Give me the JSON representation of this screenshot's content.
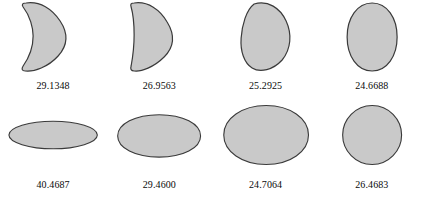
{
  "figure": {
    "background_color": "#ffffff",
    "shape_fill_color": "#c9c9c9",
    "shape_stroke_color": "#3a3a3a",
    "label_color": "#0a0a0a",
    "rows": 2,
    "columns": 4
  },
  "chart_data": {
    "type": "table",
    "title": "",
    "xlabel": "",
    "ylabel": "",
    "layout": {
      "rows": 2,
      "columns": 4,
      "grid": false,
      "legend": "none"
    },
    "categories": [
      "shape-1",
      "shape-2",
      "shape-3",
      "shape-4",
      "shape-5",
      "shape-6",
      "shape-7",
      "shape-8"
    ],
    "values": [
      29.1348,
      26.9563,
      25.2925,
      24.6688,
      40.4687,
      29.46,
      24.7064,
      26.4683
    ],
    "labels": [
      "29.1348",
      "26.9563",
      "25.2925",
      "24.6688",
      "40.4687",
      "29.4600",
      "24.7064",
      "26.4683"
    ],
    "shape_names": [
      "concave-rounded-triangle",
      "rounded-triangle",
      "asymmetric-egg",
      "vertical-ellipse",
      "flat-wide-ellipse",
      "wide-ellipse",
      "broad-ellipse",
      "circle"
    ]
  },
  "cells": [
    {
      "index": 1,
      "row": 1,
      "label": "29.1348",
      "shape_name": "concave-rounded-triangle",
      "path": "M 26 3 C 40 1 52 9 60 21 C 68 33 68 45 58 56 C 48 67 34 72 25 71 C 22 71 21 69 23 66 C 30 56 33 44 33 36 C 33 28 30 16 23 7 C 21 4 23 3 26 3 Z"
    },
    {
      "index": 2,
      "row": 1,
      "label": "26.9563",
      "shape_name": "rounded-triangle",
      "path": "M 28 3 C 42 1 54 10 61 22 C 69 35 68 47 58 57 C 48 67 35 72 28 71 C 25 71 24 69 25 66 C 27 55 28 44 28 35 C 28 25 27 14 25 7 C 24 4 25 3 28 3 Z"
    },
    {
      "index": 3,
      "row": 1,
      "label": "25.2925",
      "shape_name": "asymmetric-egg",
      "path": "M 34 4 C 48 0 60 8 66 21 C 72 34 71 49 62 60 C 53 70 40 73 32 68 C 24 63 20 51 21 38 C 22 25 26 10 34 4 Z"
    },
    {
      "index": 4,
      "row": 1,
      "label": "24.6688",
      "shape_name": "vertical-ellipse",
      "path": "M 45 3 C 60 3 70 18 70 37 C 70 56 60 71 45 71 C 30 71 20 56 20 37 C 20 18 30 3 45 3 Z"
    },
    {
      "index": 5,
      "row": 2,
      "label": "40.4687",
      "shape_name": "flat-wide-ellipse",
      "path": "M 53 23 C 79 23 101 30 101 38 C 101 46 79 53 53 53 C 27 53 5 46 5 38 C 5 30 27 23 53 23 Z"
    },
    {
      "index": 6,
      "row": 2,
      "label": "29.4600",
      "shape_name": "wide-ellipse",
      "path": "M 53 16 C 79 16 98 26 98 39 C 98 52 79 62 53 62 C 27 62 8 52 8 39 C 8 26 27 16 53 16 Z"
    },
    {
      "index": 7,
      "row": 2,
      "label": "24.7064",
      "shape_name": "broad-ellipse",
      "path": "M 53 6 C 79 6 99 20 99 38 C 99 56 79 70 53 70 C 27 70 7 56 7 38 C 7 20 27 6 53 6 Z"
    },
    {
      "index": 8,
      "row": 2,
      "label": "26.4683",
      "shape_name": "circle",
      "path": "M 49 6 C 67 6 81 21 81 38 C 81 55 67 70 49 70 C 31 70 17 55 17 38 C 17 21 31 6 49 6 Z"
    }
  ]
}
